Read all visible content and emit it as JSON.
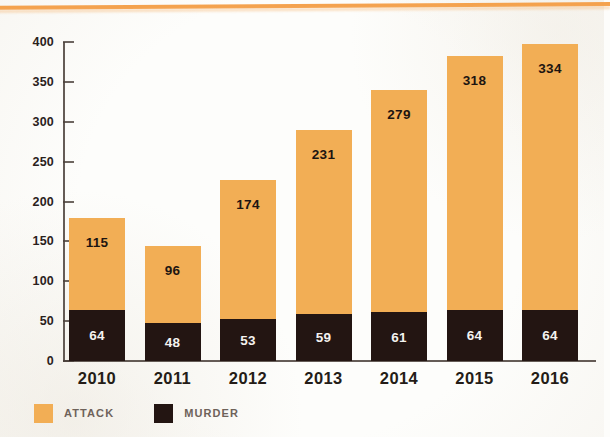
{
  "chart_data": {
    "type": "bar",
    "subtype": "stacked-bar",
    "title": "",
    "xlabel": "",
    "ylabel": "",
    "categories": [
      "2010",
      "2011",
      "2012",
      "2013",
      "2014",
      "2015",
      "2016"
    ],
    "series": [
      {
        "name": "MURDER",
        "color": "#231512",
        "values": [
          64,
          48,
          53,
          59,
          61,
          64,
          64
        ]
      },
      {
        "name": "ATTACK",
        "color": "#f2ae55",
        "values": [
          115,
          96,
          174,
          231,
          279,
          318,
          334
        ]
      }
    ],
    "totals": [
      179,
      144,
      227,
      290,
      340,
      382,
      398
    ],
    "ylim": [
      0,
      400
    ],
    "yticks": [
      0,
      50,
      100,
      150,
      200,
      250,
      300,
      350,
      400
    ],
    "ytick_labels": [
      "0",
      "50",
      "100",
      "150",
      "200",
      "250",
      "300",
      "350",
      "400"
    ],
    "grid": false,
    "legend_position": "bottom-left",
    "stack_order": [
      "MURDER",
      "ATTACK"
    ],
    "data_labels_shown": true
  },
  "legend": {
    "items": [
      {
        "label": "ATTACK",
        "color": "#f2ae55"
      },
      {
        "label": "MURDER",
        "color": "#231512"
      }
    ]
  },
  "decor": {
    "top_rule_color": "#f39a3f",
    "background_color": "#fdfdfb"
  }
}
